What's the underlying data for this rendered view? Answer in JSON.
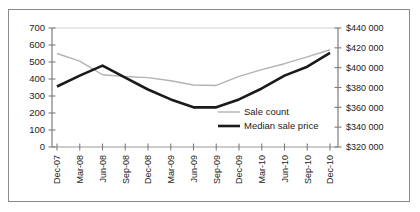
{
  "figure": {
    "clipped_top_text": "",
    "frame_border_color": "#8a8a8a",
    "background": "#ffffff"
  },
  "chart_data": {
    "type": "line",
    "title": "",
    "xlabel": "",
    "grid": false,
    "legend_position": "inside-right",
    "x": [
      "Dec-07",
      "Mar-08",
      "Jun-08",
      "Sep-08",
      "Dec-08",
      "Mar-09",
      "Jun-09",
      "Sep-09",
      "Dec-09",
      "Mar-10",
      "Jun-10",
      "Sep-10",
      "Dec-10"
    ],
    "left_axis": {
      "label": "Sale count",
      "ylim": [
        0,
        700
      ],
      "tick_step": 100,
      "ticks": [
        "0",
        "100",
        "200",
        "300",
        "400",
        "500",
        "600",
        "700"
      ]
    },
    "right_axis": {
      "label": "Median sale price",
      "ylim": [
        320000,
        440000
      ],
      "tick_step": 20000,
      "ticks": [
        "$320 000",
        "$340 000",
        "$360 000",
        "$380 000",
        "$400 000",
        "$420 000",
        "$440 000"
      ]
    },
    "series": [
      {
        "name": "Sale count",
        "axis": "left",
        "color": "#b3b3b3",
        "width": 1.4,
        "values": [
          550,
          505,
          425,
          415,
          408,
          390,
          365,
          362,
          415,
          455,
          490,
          530,
          572
        ]
      },
      {
        "name": "Median sale price",
        "axis": "right",
        "color": "#1a1a1a",
        "width": 2.6,
        "values": [
          381000,
          392000,
          402000,
          390000,
          378000,
          368000,
          360000,
          360000,
          368000,
          379000,
          392000,
          401000,
          415000
        ]
      }
    ]
  },
  "legend": {
    "entries": [
      {
        "label": "Sale count",
        "color": "#b3b3b3",
        "width": 1.4
      },
      {
        "label": "Median sale price",
        "color": "#1a1a1a",
        "width": 2.6
      }
    ]
  }
}
